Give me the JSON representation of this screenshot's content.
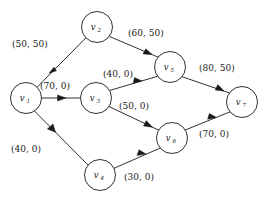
{
  "figure": {
    "caption": "",
    "nodes": [
      {
        "id": "v1",
        "label": "v",
        "subscript": "1",
        "x": 26,
        "y": 98
      },
      {
        "id": "v2",
        "label": "v",
        "subscript": "2",
        "x": 97,
        "y": 27
      },
      {
        "id": "v3",
        "label": "v",
        "subscript": "3",
        "x": 96,
        "y": 98
      },
      {
        "id": "v4",
        "label": "v",
        "subscript": "4",
        "x": 100,
        "y": 175
      },
      {
        "id": "v5",
        "label": "v",
        "subscript": "5",
        "x": 170,
        "y": 67
      },
      {
        "id": "v6",
        "label": "v",
        "subscript": "6",
        "x": 172,
        "y": 138
      },
      {
        "id": "v7",
        "label": "v",
        "subscript": "7",
        "x": 242,
        "y": 102
      }
    ],
    "node_radius": 15.5,
    "edges": [
      {
        "id": "e1",
        "from": "v1",
        "to": "v2",
        "capacity": 50,
        "flow": 50,
        "label": "(50, 50)",
        "label_x": 12,
        "label_y": 38
      },
      {
        "id": "e2",
        "from": "v1",
        "to": "v3",
        "capacity": 70,
        "flow": 0,
        "label": "(70, 0)",
        "label_x": 40,
        "label_y": 80
      },
      {
        "id": "e3",
        "from": "v1",
        "to": "v4",
        "capacity": 40,
        "flow": 0,
        "label": "(40, 0)",
        "label_x": 11,
        "label_y": 143
      },
      {
        "id": "e4",
        "from": "v2",
        "to": "v5",
        "capacity": 60,
        "flow": 50,
        "label": "(60, 50)",
        "label_x": 128,
        "label_y": 27
      },
      {
        "id": "e5",
        "from": "v3",
        "to": "v5",
        "capacity": 40,
        "flow": 0,
        "label": "(40, 0)",
        "label_x": 103,
        "label_y": 68
      },
      {
        "id": "e6",
        "from": "v3",
        "to": "v6",
        "capacity": 50,
        "flow": 0,
        "label": "(50, 0)",
        "label_x": 119,
        "label_y": 100
      },
      {
        "id": "e7",
        "from": "v4",
        "to": "v6",
        "capacity": 30,
        "flow": 0,
        "label": "(30, 0)",
        "label_x": 124,
        "label_y": 171
      },
      {
        "id": "e8",
        "from": "v5",
        "to": "v7",
        "capacity": 80,
        "flow": 50,
        "label": "(80, 50)",
        "label_x": 199,
        "label_y": 62
      },
      {
        "id": "e9",
        "from": "v6",
        "to": "v7",
        "capacity": 70,
        "flow": 0,
        "label": "(70, 0)",
        "label_x": 199,
        "label_y": 128
      }
    ]
  }
}
